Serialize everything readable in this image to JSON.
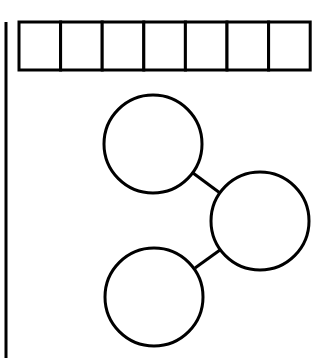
{
  "diagram": {
    "type": "number-bond-worksheet",
    "stroke_color": "#000000",
    "background": "#ffffff",
    "margin_line": {
      "x": 6,
      "y1": 22,
      "y2": 358
    },
    "box_row": {
      "x": 19,
      "y": 22,
      "box_width": 41.6,
      "height": 48,
      "count": 7,
      "values": [
        "",
        "",
        "",
        "",
        "",
        "",
        ""
      ]
    },
    "circles": [
      {
        "id": "top-part",
        "cx": 153,
        "cy": 144,
        "r": 49,
        "value": ""
      },
      {
        "id": "whole",
        "cx": 260,
        "cy": 221,
        "r": 49,
        "value": ""
      },
      {
        "id": "bottom-part",
        "cx": 154,
        "cy": 297,
        "r": 49,
        "value": ""
      }
    ],
    "connectors": [
      {
        "from": "top-part",
        "to": "whole",
        "x1": 193,
        "y1": 173,
        "x2": 220,
        "y2": 193
      },
      {
        "from": "bottom-part",
        "to": "whole",
        "x1": 195,
        "y1": 268,
        "x2": 220,
        "y2": 250
      }
    ]
  }
}
